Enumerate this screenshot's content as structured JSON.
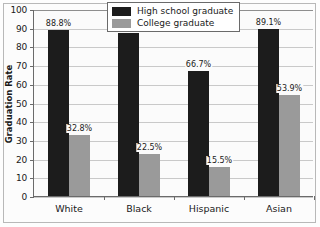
{
  "chart_data": {
    "type": "bar",
    "title": "",
    "xlabel": "",
    "ylabel": "Graduation Rate",
    "ylim": [
      0,
      100
    ],
    "ytick_step": 10,
    "yticks": [
      0,
      10,
      20,
      30,
      40,
      50,
      60,
      70,
      80,
      90,
      100
    ],
    "grid": true,
    "legend_position": "top-right-inside",
    "categories": [
      "White",
      "Black",
      "Hispanic",
      "Asian"
    ],
    "series": [
      {
        "name": "High school graduate",
        "color": "#1c1c1c",
        "values": [
          88.8,
          87.0,
          66.7,
          89.1
        ],
        "labels": [
          "88.8%",
          "87.0%",
          "66.7%",
          "89.1%"
        ]
      },
      {
        "name": "College graduate",
        "color": "#9a9a9a",
        "values": [
          32.8,
          22.5,
          15.5,
          53.9
        ],
        "labels": [
          "32.8%",
          "22.5%",
          "15.5%",
          "53.9%"
        ]
      }
    ]
  },
  "axis": {
    "y_title": "Graduation Rate",
    "y_tick_labels": [
      "100",
      "90",
      "80",
      "70",
      "60",
      "50",
      "40",
      "30",
      "20",
      "10",
      "0"
    ],
    "x_tick_labels": [
      "White",
      "Black",
      "Hispanic",
      "Asian"
    ]
  },
  "legend": {
    "entries": [
      {
        "label": "High school graduate",
        "color": "#1c1c1c"
      },
      {
        "label": "College graduate",
        "color": "#9a9a9a"
      }
    ]
  },
  "colors": {
    "high_school": "#1c1c1c",
    "college": "#9a9a9a",
    "gridline": "#c9c9c9",
    "axis": "#6a6a6a",
    "frame": "#b8b8b8",
    "plot_background": "#fbfbfb"
  }
}
